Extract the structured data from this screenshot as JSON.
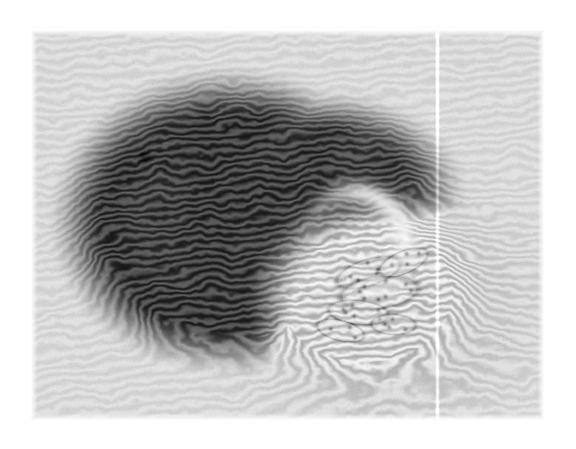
{
  "page": {
    "background_color": "#ffffff",
    "width": 576,
    "height": 449,
    "caption": "",
    "title": ""
  },
  "micrograph": {
    "name": "interference-phase-micrograph",
    "frame": {
      "x": 31,
      "y": 30,
      "width": 513,
      "height": 390
    },
    "modality": "interference / quantitative-phase light microscopy",
    "color_mode": "grayscale",
    "background_tone": "#d9d9d9",
    "darkest_tone": "#303030",
    "brightest_tone": "#f4f4f4",
    "has_scale_bar": false,
    "has_axis_labels": false,
    "has_annotations": false,
    "fringes": {
      "name": "interference-fringe-pattern",
      "description": "Near-horizontal sinusoidal interference fringes covering the whole field, tilted a few degrees, compressed and bent where they cross the specimen.",
      "background_angle_deg": 5.5,
      "background_period_px": 9.5,
      "background_amplitude": 0.035,
      "specimen_period_px": 8.0,
      "specimen_amplitude": 0.13
    },
    "artifacts": [
      {
        "name": "vertical-bright-scan-line",
        "type": "line",
        "orientation": "vertical",
        "x": 406,
        "y_start": 0,
        "y_end": 390,
        "width_px": 1.6,
        "tone": "#fbfbfb",
        "description": "Thin bright vertical detector/scan line running the full height of the frame."
      },
      {
        "name": "dark-dust-speck",
        "type": "spot",
        "x": 113,
        "y": 126,
        "radius_px": 6,
        "tone": "#b6b6b6"
      }
    ],
    "specimen": {
      "name": "specimen-body",
      "description": "Large rounded kidney/heart-shaped body occupying the centre of the field. The upper-left two thirds are strongly phase-shifting and render dark with dense fringe modulation; the lower-right lobe is thinner and renders bright with visible cellular detail.",
      "center": {
        "x": 240,
        "y": 205
      },
      "approx_width_px": 330,
      "approx_height_px": 265,
      "regions": [
        {
          "name": "dark-lobe",
          "tone": "#3a3a3a",
          "description": "Dense dark lobe, upper-left and lower-left, strongly fringed.",
          "center": {
            "x": 195,
            "y": 190
          },
          "rx": 150,
          "ry": 130
        },
        {
          "name": "bright-cellular-lobe",
          "tone": "#d0d0d0",
          "description": "Bright granular lobe, lower-right, showing cell outlines and punctate nuclei.",
          "center": {
            "x": 330,
            "y": 260
          },
          "rx": 100,
          "ry": 80
        },
        {
          "name": "specular-highlight-band",
          "tone": "#f2f2f2",
          "description": "Bright curved highlight separating the dark lobe from the bright cellular lobe.",
          "from": {
            "x": 290,
            "y": 200
          },
          "to": {
            "x": 400,
            "y": 230
          }
        },
        {
          "name": "diffuse-halo",
          "tone": "#c3c3c3",
          "description": "Soft low-contrast halo extending right and below the body where the specimen thins out.",
          "center": {
            "x": 355,
            "y": 275
          },
          "rx": 130,
          "ry": 105
        }
      ],
      "cells": {
        "name": "cell-cluster",
        "count_visible": 6,
        "description": "Cluster of elongated lens-shaped cells with dark punctate inclusions inside the bright lobe.",
        "members": [
          {
            "cx": 337,
            "cy": 242,
            "rx": 33,
            "ry": 13,
            "angle_deg": -18,
            "nuclei": 5
          },
          {
            "cx": 348,
            "cy": 262,
            "rx": 39,
            "ry": 16,
            "angle_deg": -8,
            "nuclei": 8
          },
          {
            "cx": 327,
            "cy": 282,
            "rx": 30,
            "ry": 12,
            "angle_deg": 6,
            "nuclei": 6
          },
          {
            "cx": 372,
            "cy": 232,
            "rx": 26,
            "ry": 11,
            "angle_deg": -24,
            "nuclei": 4
          },
          {
            "cx": 309,
            "cy": 300,
            "rx": 24,
            "ry": 10,
            "angle_deg": 14,
            "nuclei": 3
          },
          {
            "cx": 362,
            "cy": 294,
            "rx": 22,
            "ry": 10,
            "angle_deg": 2,
            "nuclei": 4
          }
        ]
      }
    },
    "noise": {
      "name": "sensor-grain",
      "amplitude": 0.028,
      "description": "Fine monochrome grain over the whole frame."
    }
  }
}
